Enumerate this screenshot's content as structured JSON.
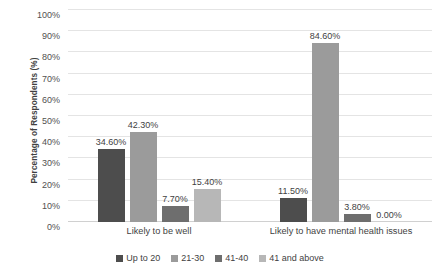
{
  "chart_data": {
    "type": "bar",
    "title": "",
    "subtitle": "",
    "xlabel": "",
    "ylabel": "Percentage of Respondents (%)",
    "ylim": [
      0,
      100
    ],
    "ytick_labels": [
      "0%",
      "10%",
      "20%",
      "30%",
      "40%",
      "50%",
      "60%",
      "70%",
      "80%",
      "90%",
      "100%"
    ],
    "ytick_values": [
      0,
      10,
      20,
      30,
      40,
      50,
      60,
      70,
      80,
      90,
      100
    ],
    "grid": true,
    "legend_position": "bottom",
    "categories": [
      "Likely to be well",
      "Likely to have mental health issues"
    ],
    "series": [
      {
        "name": "Up to 20",
        "color": "#4d4d4d",
        "values": [
          34.6,
          11.5
        ],
        "labels": [
          "34.60%",
          "11.50%"
        ]
      },
      {
        "name": "21-30",
        "color": "#9b9b9b",
        "values": [
          42.3,
          84.6
        ],
        "labels": [
          "42.30%",
          "84.60%"
        ]
      },
      {
        "name": "41-40",
        "color": "#6e6e6e",
        "values": [
          7.7,
          3.8
        ],
        "labels": [
          "7.70%",
          "3.80%"
        ]
      },
      {
        "name": "41 and above",
        "color": "#b7b7b7",
        "values": [
          15.4,
          0.0
        ],
        "labels": [
          "15.40%",
          "0.00%"
        ]
      }
    ]
  }
}
